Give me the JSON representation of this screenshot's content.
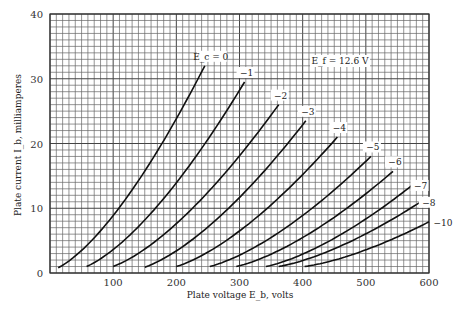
{
  "chart_data": {
    "type": "line",
    "title": "",
    "xlabel": "Plate voltage E_b, volts",
    "ylabel": "Plate current I_b, milliamperes",
    "xlim": [
      0,
      600
    ],
    "ylim": [
      0,
      40
    ],
    "x_ticks": [
      100,
      200,
      300,
      400,
      500,
      600
    ],
    "y_ticks": [
      0,
      10,
      20,
      30,
      40
    ],
    "grid": {
      "on": true,
      "x_minor_step": 10,
      "y_minor_step": 1
    },
    "annotation": "E_f = 12.6 V",
    "series": [
      {
        "name": "E_c = 0",
        "label": "E_c = 0",
        "start": [
          13,
          0.8
        ],
        "end": [
          245,
          32
        ]
      },
      {
        "name": "-1",
        "label": "−1",
        "start": [
          58,
          1.0
        ],
        "end": [
          308,
          29.5
        ]
      },
      {
        "name": "-2",
        "label": "−2",
        "start": [
          100,
          1.0
        ],
        "end": [
          362,
          26
        ]
      },
      {
        "name": "-3",
        "label": "−3",
        "start": [
          150,
          0.9
        ],
        "end": [
          405,
          23.5
        ]
      },
      {
        "name": "-4",
        "label": "−4",
        "start": [
          200,
          1.0
        ],
        "end": [
          455,
          21
        ]
      },
      {
        "name": "-5",
        "label": "−5",
        "start": [
          253,
          1.0
        ],
        "end": [
          508,
          18
        ]
      },
      {
        "name": "-6",
        "label": "−6",
        "start": [
          295,
          1.0
        ],
        "end": [
          543,
          15.7
        ]
      },
      {
        "name": "-7",
        "label": "−7",
        "start": [
          342,
          1.0
        ],
        "end": [
          574,
          13.6
        ]
      },
      {
        "name": "-8",
        "label": "−8",
        "start": [
          362,
          1.0
        ],
        "end": [
          587,
          11
        ]
      },
      {
        "name": "-10",
        "label": "−10",
        "start": [
          403,
          1.0
        ],
        "end": [
          600,
          7.9
        ]
      }
    ]
  }
}
